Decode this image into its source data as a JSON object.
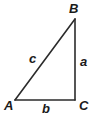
{
  "figure": {
    "kind": "right-triangle-diagram",
    "background_color": "#ffffff",
    "stroke_color": "#2b2b2b",
    "stroke_width": 1.6,
    "label_color": "#1a1a1a",
    "vertices": {
      "A": {
        "label": "A",
        "x": 15,
        "y": 100
      },
      "B": {
        "label": "B",
        "x": 75,
        "y": 19
      },
      "C": {
        "label": "C",
        "x": 75,
        "y": 100
      }
    },
    "sides": {
      "a": {
        "label": "a",
        "from": "B",
        "to": "C"
      },
      "b": {
        "label": "b",
        "from": "A",
        "to": "C"
      },
      "c": {
        "label": "c",
        "from": "A",
        "to": "B"
      }
    },
    "right_angle_at": "C"
  }
}
